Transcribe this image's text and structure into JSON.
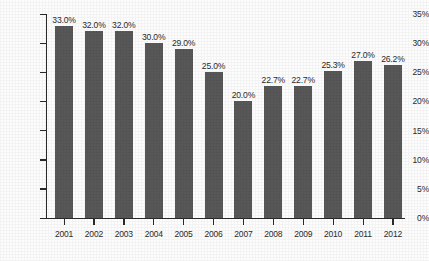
{
  "chart_data": {
    "type": "bar",
    "title": "",
    "subtitle": "",
    "xlabel": "",
    "ylabel": "",
    "categories": [
      "2001",
      "2002",
      "2003",
      "2004",
      "2005",
      "2006",
      "2007",
      "2008",
      "2009",
      "2010",
      "2011",
      "2012"
    ],
    "values": [
      33.0,
      32.0,
      32.0,
      30.0,
      29.0,
      25.0,
      20.0,
      22.7,
      22.7,
      25.3,
      27.0,
      26.2
    ],
    "data_labels": [
      "33.0%",
      "32.0%",
      "32.0%",
      "30.0%",
      "29.0%",
      "25.0%",
      "20.0%",
      "22.7%",
      "22.7%",
      "25.3%",
      "27.0%",
      "26.2%"
    ],
    "ylim": [
      0,
      35
    ],
    "yticks": [
      0,
      5,
      10,
      15,
      20,
      25,
      30,
      35
    ],
    "ytick_labels": [
      "0%",
      "5%",
      "10%",
      "15%",
      "20%",
      "25%",
      "30%",
      "35%"
    ],
    "grid": false,
    "legend": null,
    "legend_position": "none",
    "series": [
      {
        "name": "",
        "values": [
          33.0,
          32.0,
          32.0,
          30.0,
          29.0,
          25.0,
          20.0,
          22.7,
          22.7,
          25.3,
          27.0,
          26.2
        ],
        "color": "#585858"
      }
    ],
    "colors": {
      "bar": "#585858",
      "axis": "#2a2a2a",
      "text": "#2b2b2b",
      "background": "#fdfdfd"
    }
  }
}
